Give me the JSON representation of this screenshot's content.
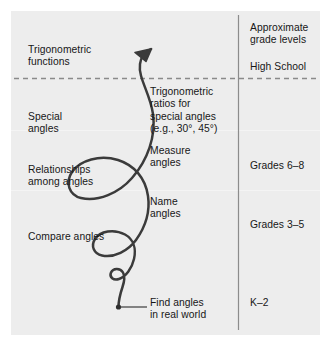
{
  "figure": {
    "type": "learning-progression-spiral",
    "panel_color": "#ededed",
    "page_color": "#ffffff",
    "curve_color": "#3b3b3b",
    "text_color": "#171717",
    "divider_color": "#8c8c8c"
  },
  "progression": {
    "items": [
      {
        "id": "trig-functions",
        "label": "Trigonometric\nfunctions"
      },
      {
        "id": "special-angles",
        "label": "Special\nangles"
      },
      {
        "id": "relationships",
        "label": "Relationships\namong angles"
      },
      {
        "id": "compare-angles",
        "label": "Compare angles"
      }
    ]
  },
  "milestones": {
    "items": [
      {
        "id": "trig-ratios",
        "label": "Trigonometric\nratios for\nspecial angles\n(e.g., 30°, 45°)"
      },
      {
        "id": "measure-angles",
        "label": "Measure\nangles"
      },
      {
        "id": "name-angles",
        "label": "Name\nangles"
      },
      {
        "id": "find-angles",
        "label": "Find angles\nin real world"
      }
    ]
  },
  "grade_levels": {
    "header": "Approximate\ngrade levels",
    "items": [
      {
        "id": "high-school",
        "label": "High School"
      },
      {
        "id": "grades-6-8",
        "label": "Grades 6–8"
      },
      {
        "id": "grades-3-5",
        "label": "Grades 3–5"
      },
      {
        "id": "k-2",
        "label": "K–2"
      }
    ]
  }
}
